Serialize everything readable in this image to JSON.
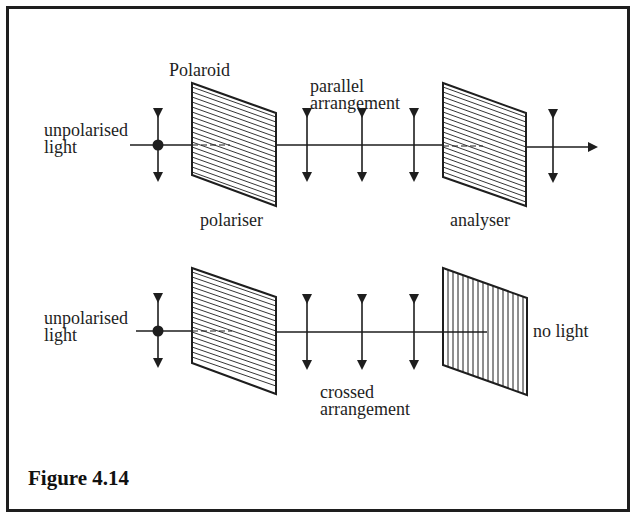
{
  "figure": {
    "caption": "Figure 4.14",
    "colors": {
      "ink": "#1e1e1e",
      "background": "#ffffff"
    }
  },
  "top_panel": {
    "polaroid_label": "Polaroid",
    "source_label_line1": "unpolarised",
    "source_label_line2": "light",
    "arrangement_line1": "parallel",
    "arrangement_line2": "arrangement",
    "polariser_label": "polariser",
    "analyser_label": "analyser",
    "polariser_hatch": "horizontal",
    "analyser_hatch": "horizontal",
    "output": "transmitted"
  },
  "bottom_panel": {
    "source_label_line1": "unpolarised",
    "source_label_line2": "light",
    "arrangement_line1": "crossed",
    "arrangement_line2": "arrangement",
    "result_label": "no light",
    "polariser_hatch": "horizontal",
    "analyser_hatch": "vertical",
    "output": "blocked"
  }
}
